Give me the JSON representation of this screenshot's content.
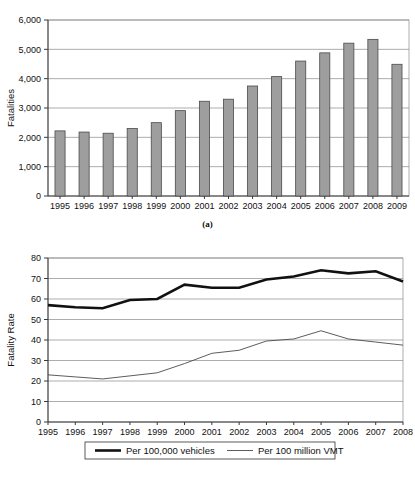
{
  "figure": {
    "panel_a_caption": "(a)",
    "panel_b_caption": "(b)"
  },
  "chart_data": [
    {
      "id": "panel-a",
      "type": "bar",
      "title": "",
      "xlabel": "",
      "ylabel": "Fatalities",
      "categories": [
        "1995",
        "1996",
        "1997",
        "1998",
        "1999",
        "2000",
        "2001",
        "2002",
        "2003",
        "2004",
        "2005",
        "2006",
        "2007",
        "2008",
        "2009"
      ],
      "values": [
        2220,
        2180,
        2140,
        2300,
        2500,
        2910,
        3230,
        3300,
        3750,
        4070,
        4600,
        4880,
        5210,
        5340,
        4490
      ],
      "ylim": [
        0,
        6000
      ],
      "yticks": [
        0,
        1000,
        2000,
        3000,
        4000,
        5000,
        6000
      ],
      "ytick_labels": [
        "0",
        "1,000",
        "2,000",
        "3,000",
        "4,000",
        "5,000",
        "6,000"
      ],
      "grid": true,
      "legend": "none",
      "bar_color": "#9e9e9e",
      "bar_edge_color": "#4a4a4a"
    },
    {
      "id": "panel-b",
      "type": "line",
      "title": "",
      "xlabel": "",
      "ylabel": "Fatality Rate",
      "x": [
        "1995",
        "1996",
        "1997",
        "1998",
        "1999",
        "2000",
        "2001",
        "2002",
        "2003",
        "2004",
        "2005",
        "2006",
        "2007",
        "2008"
      ],
      "ylim": [
        0,
        80
      ],
      "yticks": [
        0,
        10,
        20,
        30,
        40,
        50,
        60,
        70,
        80
      ],
      "ytick_labels": [
        "0",
        "10",
        "20",
        "30",
        "40",
        "50",
        "60",
        "70",
        "80"
      ],
      "grid": true,
      "legend": "bottom",
      "series": [
        {
          "name": "Per 100,000 vehicles",
          "style": "thick",
          "color": "#111111",
          "values": [
            57.0,
            56.0,
            55.5,
            59.5,
            60.0,
            67.0,
            65.5,
            65.5,
            69.5,
            71.0,
            74.0,
            72.5,
            73.5,
            68.5
          ]
        },
        {
          "name": "Per 100 million VMT",
          "style": "thin",
          "color": "#4a4a4a",
          "values": [
            23.0,
            22.0,
            21.0,
            22.5,
            24.0,
            28.5,
            33.5,
            35.0,
            39.5,
            40.5,
            44.5,
            40.5,
            39.0,
            37.5
          ]
        }
      ]
    }
  ]
}
